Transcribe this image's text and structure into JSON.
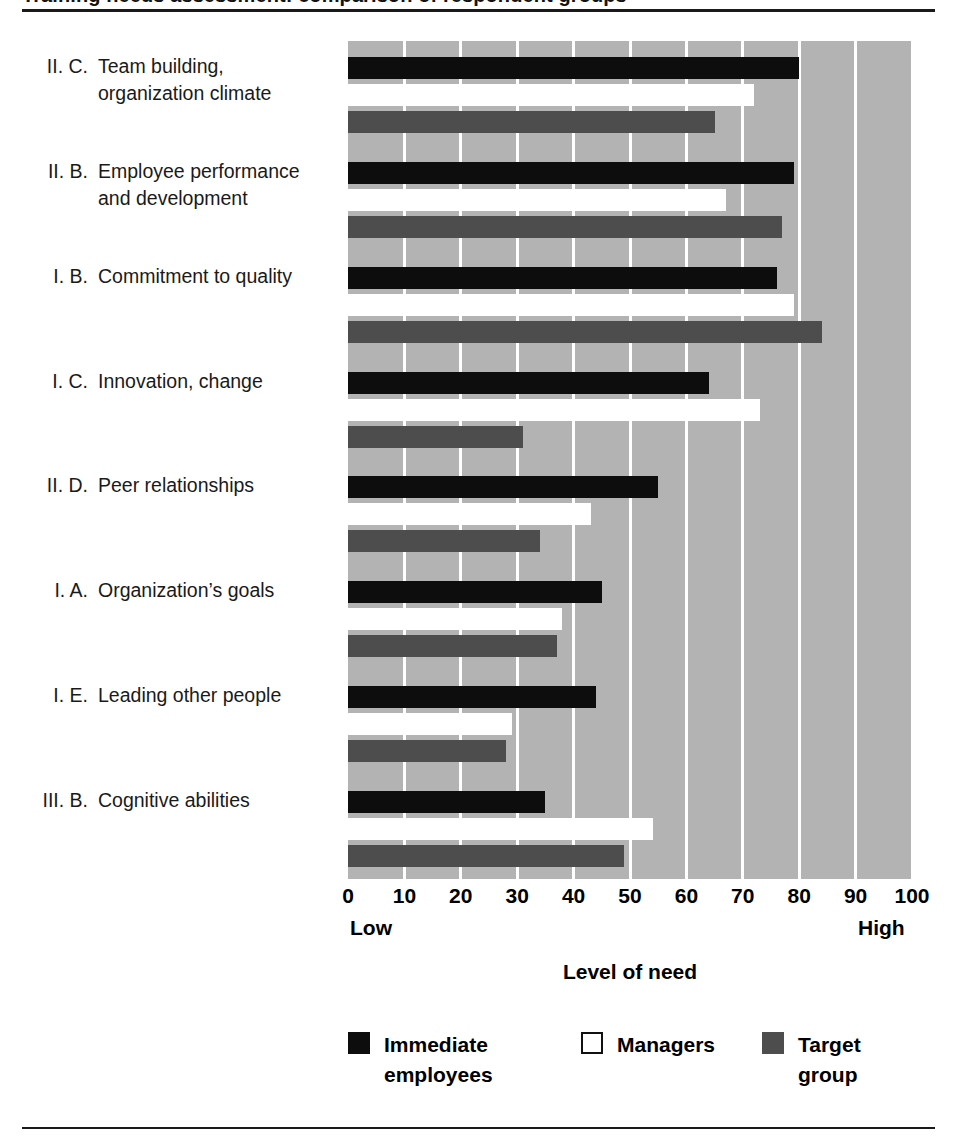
{
  "figure": {
    "title_clipped": "Training needs assessment: comparison of respondent groups",
    "axis_title": "Level of need",
    "low_label": "Low",
    "high_label": "High"
  },
  "colors": {
    "plot_background": "#b3b3b3",
    "gridline": "#ffffff",
    "immediate_employees": "#0d0d0d",
    "managers": "#ffffff",
    "target_group": "#4d4d4d",
    "rule": "#1a1a1a"
  },
  "legend": {
    "position": "bottom",
    "items": [
      {
        "key": "immediate",
        "label": "Immediate\nemployees",
        "color": "#0d0d0d"
      },
      {
        "key": "managers",
        "label": "Managers",
        "color": "#ffffff"
      },
      {
        "key": "target",
        "label": "Target group",
        "color": "#4d4d4d"
      }
    ]
  },
  "chart_data": {
    "type": "bar",
    "orientation": "horizontal",
    "title": "",
    "xlabel": "Level of need",
    "ylabel": "",
    "xlim": [
      0,
      100
    ],
    "xticks": [
      0,
      10,
      20,
      30,
      40,
      50,
      60,
      70,
      80,
      90,
      100
    ],
    "xtick_labels": [
      "0",
      "10",
      "20",
      "30",
      "40",
      "50",
      "60",
      "70",
      "80",
      "90",
      "100"
    ],
    "xaxis_end_labels": {
      "left": "Low",
      "right": "High"
    },
    "grid": true,
    "grid_axis": "x",
    "legend_position": "bottom",
    "categories": [
      {
        "num": "II. C.",
        "text": "Team building,\norganization climate"
      },
      {
        "num": "II. B.",
        "text": "Employee performance\nand development"
      },
      {
        "num": "I. B.",
        "text": "Commitment to quality"
      },
      {
        "num": "I. C.",
        "text": "Innovation, change"
      },
      {
        "num": "II. D.",
        "text": "Peer relationships"
      },
      {
        "num": "I. A.",
        "text": "Organization’s goals"
      },
      {
        "num": "I. E.",
        "text": "Leading other people"
      },
      {
        "num": "III. B.",
        "text": "Cognitive abilities"
      }
    ],
    "category_labels": [
      "II. C. Team building, organization climate",
      "II. B. Employee performance and development",
      "I. B. Commitment to quality",
      "I. C. Innovation, change",
      "II. D. Peer relationships",
      "I. A. Organization’s goals",
      "I. E. Leading other people",
      "III. B. Cognitive abilities"
    ],
    "series": [
      {
        "name": "Immediate employees",
        "color": "#0d0d0d",
        "values": [
          80,
          79,
          76,
          64,
          55,
          45,
          44,
          35
        ]
      },
      {
        "name": "Managers",
        "color": "#ffffff",
        "values": [
          72,
          67,
          79,
          73,
          43,
          38,
          29,
          54
        ]
      },
      {
        "name": "Target group",
        "color": "#4d4d4d",
        "values": [
          65,
          77,
          84,
          31,
          34,
          37,
          28,
          49
        ]
      }
    ]
  }
}
